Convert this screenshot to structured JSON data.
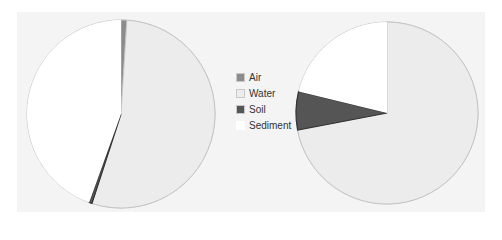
{
  "chart_data": [
    {
      "type": "pie",
      "title": "",
      "categories": [
        "Air",
        "Water",
        "Soil",
        "Sediment"
      ],
      "values": [
        1.0,
        54.0,
        0.5,
        44.5
      ],
      "unit": "%",
      "center": [
        121,
        114
      ],
      "radius": 94,
      "start_angle_deg": 0,
      "direction": "clockwise"
    },
    {
      "type": "pie",
      "title": "",
      "categories": [
        "Air",
        "Water",
        "Soil",
        "Sediment"
      ],
      "values": [
        0.0,
        72.0,
        6.8,
        21.2
      ],
      "unit": "%",
      "center": [
        387,
        113
      ],
      "radius": 91,
      "start_angle_deg": 0,
      "direction": "clockwise"
    }
  ],
  "legend": {
    "position": "center",
    "items": [
      {
        "label": "Air",
        "color": "#8c8c8c"
      },
      {
        "label": "Water",
        "color": "#ececec"
      },
      {
        "label": "Soil",
        "color": "#555555"
      },
      {
        "label": "Sediment",
        "color": "#ffffff"
      }
    ]
  },
  "colors": {
    "background": "#f4f4f4",
    "outline": "#c0c0c0"
  }
}
